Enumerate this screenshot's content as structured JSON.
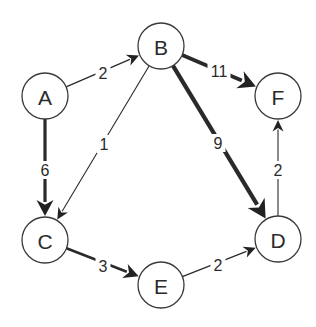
{
  "diagram": {
    "type": "directed-weighted-graph",
    "nodes": [
      {
        "id": "A",
        "label": "A",
        "x": 45,
        "y": 96
      },
      {
        "id": "B",
        "label": "B",
        "x": 161,
        "y": 46
      },
      {
        "id": "C",
        "label": "C",
        "x": 45,
        "y": 240
      },
      {
        "id": "D",
        "label": "D",
        "x": 278,
        "y": 239
      },
      {
        "id": "E",
        "label": "E",
        "x": 161,
        "y": 285
      },
      {
        "id": "F",
        "label": "F",
        "x": 278,
        "y": 96
      }
    ],
    "edges": [
      {
        "from": "A",
        "to": "B",
        "weight": "2",
        "width": 1.3,
        "label_x": 103,
        "label_y": 73
      },
      {
        "from": "A",
        "to": "C",
        "weight": "6",
        "width": 3.2,
        "label_x": 45,
        "label_y": 170
      },
      {
        "from": "B",
        "to": "C",
        "weight": "1",
        "width": 1.1,
        "label_x": 104,
        "label_y": 144
      },
      {
        "from": "B",
        "to": "F",
        "weight": "11",
        "width": 3.8,
        "label_x": 219,
        "label_y": 71
      },
      {
        "from": "B",
        "to": "D",
        "weight": "9",
        "width": 4.2,
        "label_x": 218,
        "label_y": 143
      },
      {
        "from": "C",
        "to": "E",
        "weight": "3",
        "width": 2.6,
        "label_x": 103,
        "label_y": 266
      },
      {
        "from": "E",
        "to": "D",
        "weight": "2",
        "width": 1.3,
        "label_x": 218,
        "label_y": 265
      },
      {
        "from": "D",
        "to": "F",
        "weight": "2",
        "width": 1.1,
        "label_x": 278,
        "label_y": 170
      }
    ],
    "node_radius": 23,
    "colors": {
      "stroke": "#2a2a2a",
      "fill": "#ffffff",
      "text": "#2b2b2b"
    }
  }
}
